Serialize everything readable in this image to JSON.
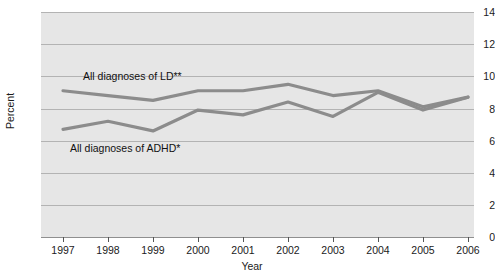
{
  "chart_data": {
    "type": "line",
    "title": "",
    "xlabel": "Year",
    "ylabel": "Percent",
    "categories": [
      "1997",
      "1998",
      "1999",
      "2000",
      "2001",
      "2002",
      "2003",
      "2004",
      "2005",
      "2006"
    ],
    "xlim": [
      1997,
      2006
    ],
    "ylim": [
      0,
      14
    ],
    "yticks": [
      0,
      2,
      4,
      6,
      8,
      10,
      12,
      14
    ],
    "ytick_labels": [
      "0",
      "2",
      "4",
      "6",
      "8",
      "10",
      "12",
      "14"
    ],
    "grid": true,
    "legend_position": "inline-annotations",
    "plot_bgcolor": "#e6e6e6",
    "gridline_color": "#b3b3b3",
    "series": [
      {
        "name": "All diagnoses of LD**",
        "color": "#8c8c8c",
        "annotation": "All diagnoses of LD**",
        "values": [
          9.1,
          8.8,
          8.5,
          9.1,
          9.1,
          9.5,
          8.8,
          9.1,
          8.1,
          8.7
        ]
      },
      {
        "name": "All diagnoses of ADHD*",
        "color": "#8c8c8c",
        "annotation": "All diagnoses of ADHD*",
        "values": [
          6.7,
          7.2,
          6.6,
          7.9,
          7.6,
          8.4,
          7.5,
          9.0,
          7.9,
          8.7
        ]
      }
    ]
  },
  "axis": {
    "y_title": "Percent",
    "x_title": "Year"
  }
}
